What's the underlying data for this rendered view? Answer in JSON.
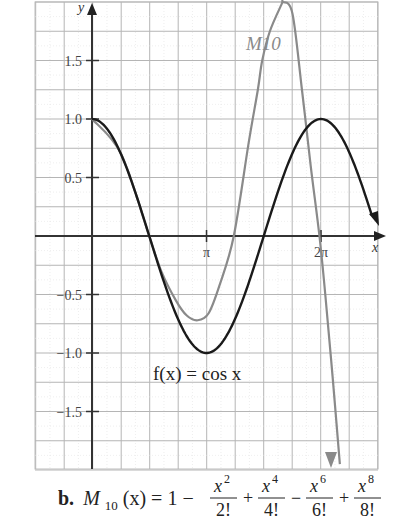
{
  "chart_data": {
    "type": "line",
    "title": "",
    "caption": {
      "label": "b.",
      "lhs": "M",
      "lhs_sub": "10",
      "lhs_arg": "(x) = 1 −",
      "terms": [
        {
          "num_base": "x",
          "num_exp": "2",
          "den": "2!",
          "op_after": "+"
        },
        {
          "num_base": "x",
          "num_exp": "4",
          "den": "4!",
          "op_after": "−"
        },
        {
          "num_base": "x",
          "num_exp": "6",
          "den": "6!",
          "op_after": "+"
        },
        {
          "num_base": "x",
          "num_exp": "8",
          "den": "8!",
          "op_after": ""
        }
      ]
    },
    "xlabel": "x",
    "ylabel": "y",
    "x_ticks": [
      {
        "value": 3.14159,
        "label": "π"
      },
      {
        "value": 6.28319,
        "label": "2π"
      }
    ],
    "y_ticks": [
      {
        "value": 1.5,
        "label": "1.5"
      },
      {
        "value": 1.0,
        "label": "1.0"
      },
      {
        "value": 0.5,
        "label": "0.5"
      },
      {
        "value": -0.5,
        "label": "−0.5"
      },
      {
        "value": -1.0,
        "label": "−1.0"
      },
      {
        "value": -1.5,
        "label": "−1.5"
      }
    ],
    "xlim": [
      -1.57,
      7.85
    ],
    "ylim": [
      -2.0,
      2.0
    ],
    "grid": true,
    "series": [
      {
        "name": "f(x) = cos x",
        "label": "f(x) = cos x",
        "color": "#1a1a1a",
        "function": "cos",
        "x": [
          0,
          0.785,
          1.571,
          2.356,
          3.142,
          3.927,
          4.712,
          5.498,
          6.283,
          7.75
        ],
        "y": [
          1.0,
          0.707,
          0.0,
          -0.707,
          -1.0,
          -0.707,
          0.0,
          0.707,
          1.0,
          0.12
        ]
      },
      {
        "name": "M10",
        "label": "M10",
        "color": "#8a8a8a",
        "x": [
          0,
          0.8,
          1.57,
          1.9,
          2.3,
          2.6,
          2.9,
          3.2,
          3.5,
          3.89,
          4.3,
          4.55,
          4.67,
          4.88,
          5.2,
          5.24,
          5.5,
          5.76,
          6.0,
          6.24,
          6.4,
          6.6,
          6.8,
          6.56
        ],
        "y": [
          1.0,
          0.7,
          0.0,
          -0.3,
          -0.55,
          -0.68,
          -0.72,
          -0.66,
          -0.42,
          0.0,
          0.8,
          1.25,
          1.5,
          1.75,
          1.98,
          2.0,
          1.9,
          1.25,
          0.6,
          0.0,
          -0.5,
          -1.2,
          -1.95,
          -1.97
        ]
      }
    ],
    "legend": "inline labels"
  }
}
